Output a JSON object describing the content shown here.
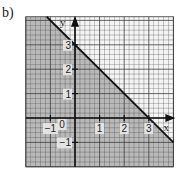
{
  "figure": {
    "part_label": "b)"
  },
  "chart_data": {
    "type": "line",
    "title": "",
    "xlabel": "x",
    "ylabel": "y",
    "xlim": [
      -2,
      4
    ],
    "ylim": [
      -2,
      4.15
    ],
    "grid": true,
    "grid_minor_step": 0.2,
    "x_ticks": [
      {
        "value": -1,
        "label": "−1"
      },
      {
        "value": 1,
        "label": "1"
      },
      {
        "value": 2,
        "label": "2"
      },
      {
        "value": 3,
        "label": "3"
      }
    ],
    "y_ticks": [
      {
        "value": 3,
        "label": "3"
      },
      {
        "value": 2,
        "label": "2"
      },
      {
        "value": 1,
        "label": "1"
      },
      {
        "value": -1,
        "label": "−1"
      }
    ],
    "origin_label": "0",
    "series": [
      {
        "name": "boundary line x + y = 3",
        "x": [
          -1.15,
          4
        ],
        "y": [
          4.15,
          -1
        ]
      }
    ],
    "shaded_region": {
      "description": "x + y <= 3 (below/left of line)",
      "polygon": [
        [
          -2,
          4.15
        ],
        [
          -1.15,
          4.15
        ],
        [
          4,
          -1
        ],
        [
          4,
          -2
        ],
        [
          -2,
          -2
        ]
      ]
    },
    "colors": {
      "shade": "#b9b9b9",
      "grid_line": "#3a3a3a",
      "background": "#f4f4f4",
      "axis": "#111111",
      "boundary": "#111111"
    }
  }
}
